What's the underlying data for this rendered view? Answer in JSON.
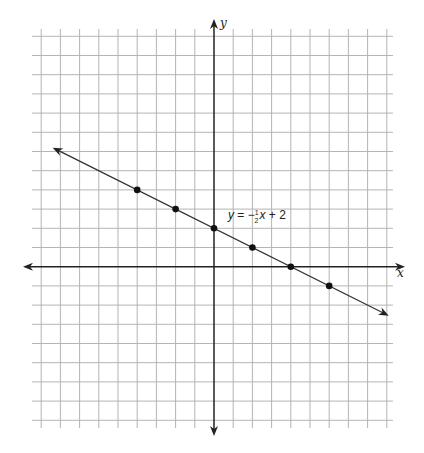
{
  "chart_data": {
    "type": "line",
    "title": "",
    "xlabel": "x",
    "ylabel": "y",
    "grid": true,
    "xlim": [
      -9,
      9
    ],
    "ylim": [
      -8,
      12
    ],
    "axes_arrows": true,
    "series": [
      {
        "name": "y = -1/2 x + 2",
        "slope": -0.5,
        "intercept": 2,
        "x_range": [
          -8.4,
          9.1
        ],
        "arrows_both_ends": true,
        "color": "#333333",
        "points": [
          {
            "x": -4,
            "y": 4
          },
          {
            "x": -2,
            "y": 3
          },
          {
            "x": 0,
            "y": 2
          },
          {
            "x": 2,
            "y": 1
          },
          {
            "x": 4,
            "y": 0
          },
          {
            "x": 6,
            "y": -1
          }
        ]
      }
    ],
    "annotations": [
      {
        "text_parts": {
          "y": "y",
          "equals": " = −",
          "num": "1",
          "den": "2",
          "x": "x",
          "rest": " + 2"
        },
        "anchor": {
          "x": 0.7,
          "y": 2.6
        }
      }
    ],
    "colors": {
      "grid": "#b4b4b4",
      "axes": "#222222",
      "line": "#333333",
      "points": "#111111"
    }
  }
}
